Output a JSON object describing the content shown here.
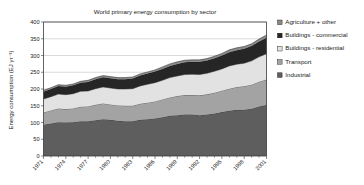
{
  "chart_data": {
    "type": "area",
    "stacked": true,
    "title": "World primary energy consumption by sector",
    "xlabel": "",
    "ylabel": "Energy consumption (EJ yr⁻¹)",
    "ylim": [
      0,
      400
    ],
    "ytick_values": [
      0,
      50,
      100,
      150,
      200,
      250,
      300,
      350,
      400
    ],
    "ytick_labels": [
      "0",
      "50",
      "100",
      "150",
      "200",
      "250",
      "300",
      "350",
      "400"
    ],
    "xlim": [
      1971,
      2001
    ],
    "grid": true,
    "grid_axis": "y",
    "legend_position": "right",
    "x": [
      1971,
      1972,
      1973,
      1974,
      1975,
      1976,
      1977,
      1978,
      1979,
      1980,
      1981,
      1982,
      1983,
      1984,
      1985,
      1986,
      1987,
      1988,
      1989,
      1990,
      1991,
      1992,
      1993,
      1994,
      1995,
      1996,
      1997,
      1998,
      1999,
      2000,
      2001
    ],
    "xtick_values": [
      1971,
      1974,
      1977,
      1980,
      1983,
      1986,
      1989,
      1992,
      1995,
      1998,
      2001
    ],
    "xtick_labels": [
      "1971",
      "1974",
      "1977",
      "1980",
      "1983",
      "1986",
      "1989",
      "1992",
      "1995",
      "1998",
      "2001"
    ],
    "series": [
      {
        "name": "Industrial",
        "color": "#5e5e5e",
        "values": [
          93,
          97,
          101,
          100,
          101,
          104,
          104,
          107,
          110,
          108,
          105,
          104,
          104,
          108,
          110,
          112,
          116,
          120,
          122,
          124,
          124,
          122,
          124,
          127,
          131,
          135,
          138,
          138,
          141,
          148,
          152
        ]
      },
      {
        "name": "Transport",
        "color": "#a3a3a3",
        "values": [
          37,
          39,
          41,
          40,
          41,
          43,
          44,
          46,
          47,
          46,
          46,
          46,
          46,
          48,
          49,
          51,
          53,
          55,
          57,
          58,
          58,
          59,
          60,
          62,
          64,
          66,
          68,
          70,
          72,
          74,
          76
        ]
      },
      {
        "name": "Buildings - residential",
        "color": "#e2e2e2",
        "values": [
          40,
          41,
          43,
          43,
          44,
          46,
          46,
          48,
          49,
          49,
          49,
          50,
          51,
          53,
          55,
          56,
          57,
          59,
          60,
          61,
          62,
          62,
          63,
          64,
          65,
          68,
          68,
          69,
          71,
          74,
          77
        ]
      },
      {
        "name": "Buildings - commercial",
        "color": "#262626",
        "values": [
          22,
          23,
          24,
          24,
          25,
          26,
          27,
          28,
          29,
          29,
          29,
          29,
          30,
          31,
          32,
          33,
          34,
          35,
          36,
          37,
          37,
          38,
          38,
          39,
          40,
          41,
          42,
          43,
          44,
          46,
          48
        ]
      },
      {
        "name": "Agriculture + other",
        "color": "#8a8a8a",
        "values": [
          4,
          4,
          4,
          4,
          4,
          4,
          5,
          5,
          5,
          5,
          5,
          5,
          5,
          5,
          5,
          5,
          6,
          6,
          6,
          6,
          6,
          6,
          6,
          6,
          6,
          7,
          7,
          7,
          7,
          7,
          8
        ]
      }
    ],
    "legend_entries": [
      {
        "label": "Agriculture + other",
        "color": "#8a8a8a"
      },
      {
        "label": "Buildings - commercial",
        "color": "#262626"
      },
      {
        "label": "Buildings - residential",
        "color": "#e2e2e2"
      },
      {
        "label": "Transport",
        "color": "#a3a3a3"
      },
      {
        "label": "Industrial",
        "color": "#5e5e5e"
      }
    ]
  }
}
